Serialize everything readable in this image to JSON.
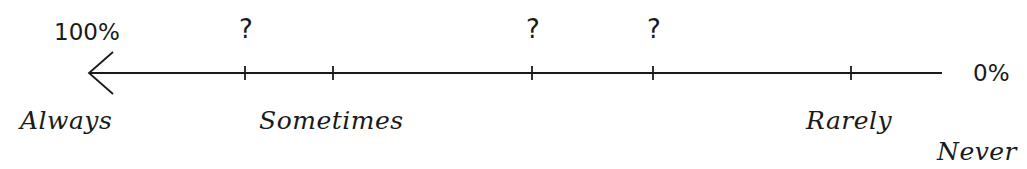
{
  "scale": {
    "left_end_label": "100%",
    "right_end_label": "0%",
    "direction": "arrow points left toward 100%",
    "line_color": "#1a1a1a",
    "ticks": [
      {
        "x": 245,
        "marker": "?"
      },
      {
        "x": 333,
        "marker": ""
      },
      {
        "x": 532,
        "marker": "?"
      },
      {
        "x": 653,
        "marker": "?"
      },
      {
        "x": 851,
        "marker": ""
      }
    ],
    "question_marks": [
      "?",
      "?",
      "?"
    ],
    "frequency_labels": {
      "always": "Always",
      "sometimes": "Sometimes",
      "rarely": "Rarely",
      "never": "Never"
    }
  }
}
